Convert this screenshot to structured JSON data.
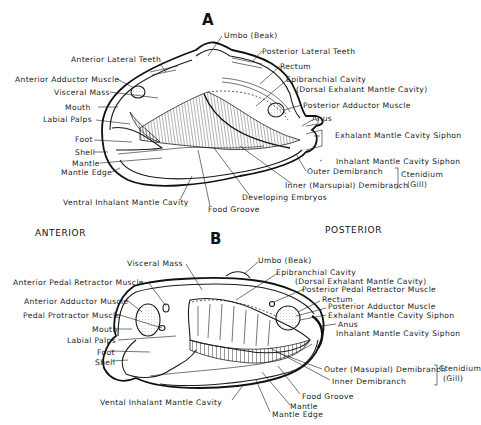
{
  "figure": {
    "orientation": {
      "left": "ANTERIOR",
      "right": "POSTERIOR"
    },
    "panel_a": {
      "letter": "A",
      "labels": {
        "umbo": "Umbo (Beak)",
        "anterior_lateral_teeth": "Anterior Lateral Teeth",
        "posterior_lateral_teeth": "Posterior Lateral Teeth",
        "anterior_adductor_muscle": "Anterior Adductor Muscle",
        "rectum": "Rectum",
        "visceral_mass": "Visceral Mass",
        "epibranchial_cavity": "Epibranchial Cavity",
        "epibranchial_cavity_sub": "(Dorsal Exhalant Mantle Cavity)",
        "mouth": "Mouth",
        "posterior_adductor_muscle": "Posterior Adductor Muscle",
        "labial_palps": "Labial Palps",
        "anus": "Anus",
        "foot": "Foot",
        "exhalant_siphon": "Exhalant Mantle Cavity Siphon",
        "shell": "Shell",
        "inhalant_siphon": "Inhalant Mantle Cavity Siphon",
        "mantle": "Mantle",
        "outer_demibranch": "Outer Demibranch",
        "mantle_edge": "Mantle Edge",
        "inner_demibranch": "Inner (Marsupial) Demibranch",
        "ctenidium": "Ctenidium",
        "gill": "(Gill)",
        "developing_embryos": "Developing Embryos",
        "ventral_inhalant": "Ventral Inhalant Mantle Cavity",
        "food_groove": "Food Groove"
      }
    },
    "panel_b": {
      "letter": "B",
      "labels": {
        "visceral_mass": "Visceral Mass",
        "umbo": "Umbo (Beak)",
        "epibranchial_cavity": "Epibranchial Cavity",
        "epibranchial_cavity_sub": "(Dorsal Exhalant Mantle Cavity)",
        "anterior_pedal_retractor": "Anterior Pedal Retractor Muscle",
        "posterior_pedal_retractor": "Posterior Pedal Retractor Muscle",
        "rectum": "Rectum",
        "anterior_adductor_muscle": "Anterior Adductor Muscle",
        "posterior_adductor_muscle": "Posterior Adductor Muscle",
        "pedal_protractor": "Pedal Protractor Muscle",
        "exhalant_siphon": "Exhalant Mantle Cavity Siphon",
        "mouth": "Mouth",
        "anus": "Anus",
        "labial_palps": "Labial Palps",
        "inhalant_siphon": "Inhalant Mantle Cavity Siphon",
        "foot": "Foot",
        "shell": "Shell",
        "outer_demibranch": "Outer (Masupial) Demibranch",
        "ctenidium": "Ctenidium",
        "gill": "(Gill)",
        "inner_demibranch": "Inner Demibranch",
        "ventral_inhalant": "Vental Inhalant Mantle Cavity",
        "food_groove": "Food Groove",
        "mantle": "Mantle",
        "mantle_edge": "Mantle Edge"
      }
    }
  }
}
